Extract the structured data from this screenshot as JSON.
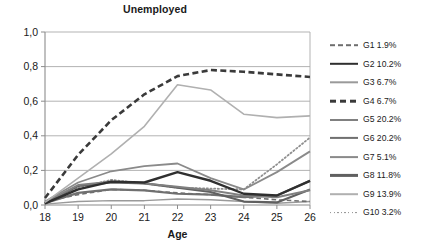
{
  "chart_data": {
    "type": "line",
    "title": "Unemployed",
    "xlabel": "Age",
    "ylabel": "",
    "x": [
      18,
      19,
      20,
      21,
      22,
      23,
      24,
      25,
      26
    ],
    "xtick_labels": [
      "18",
      "19",
      "20",
      "21",
      "22",
      "23",
      "24",
      "25",
      "26"
    ],
    "ytick_labels": [
      "0,0",
      "0,2",
      "0,4",
      "0,6",
      "0,8",
      "1,0"
    ],
    "ytick_values": [
      0.0,
      0.2,
      0.4,
      0.6,
      0.8,
      1.0
    ],
    "ylim": [
      0.0,
      1.0
    ],
    "xlim": [
      18,
      26
    ],
    "grid": "horizontal",
    "legend_position": "right",
    "series": [
      {
        "name": "G1 1.9%",
        "label": "G1 1.9%",
        "color": "#6e6e6e",
        "style": "dashed",
        "width": 1.6,
        "values": [
          0.02,
          0.06,
          0.09,
          0.085,
          0.07,
          0.06,
          0.045,
          0.03,
          0.02
        ]
      },
      {
        "name": "G2 10.2%",
        "label": "G2 10.2%",
        "color": "#2f2f2f",
        "style": "solid",
        "width": 2.4,
        "values": [
          0.01,
          0.09,
          0.135,
          0.13,
          0.19,
          0.14,
          0.065,
          0.055,
          0.14
        ]
      },
      {
        "name": "G3 6.7%",
        "label": "G3 6.7%",
        "color": "#9a9a9a",
        "style": "solid",
        "width": 1.4,
        "values": [
          0.005,
          0.02,
          0.025,
          0.025,
          0.035,
          0.03,
          0.02,
          0.01,
          0.02
        ]
      },
      {
        "name": "G4 6.7%",
        "label": "G4 6.7%",
        "color": "#3a3a3a",
        "style": "dashed",
        "width": 2.6,
        "values": [
          0.04,
          0.29,
          0.49,
          0.64,
          0.745,
          0.78,
          0.77,
          0.755,
          0.74
        ]
      },
      {
        "name": "G5 20.2%",
        "label": "G5 20.2%",
        "color": "#808080",
        "style": "solid",
        "width": 2.0,
        "values": [
          0.015,
          0.115,
          0.135,
          0.125,
          0.105,
          0.085,
          0.055,
          0.045,
          0.085
        ]
      },
      {
        "name": "G6 20.2%",
        "label": "G6 20.2%",
        "color": "#707070",
        "style": "solid",
        "width": 2.2,
        "values": [
          0.01,
          0.07,
          0.09,
          0.085,
          0.065,
          0.06,
          0.045,
          0.055,
          0.14
        ]
      },
      {
        "name": "G7 5.1%",
        "label": "G7 5.1%",
        "color": "#8a8a8a",
        "style": "solid",
        "width": 1.8,
        "values": [
          0.02,
          0.13,
          0.195,
          0.225,
          0.24,
          0.155,
          0.09,
          0.19,
          0.31
        ]
      },
      {
        "name": "G8 11.8%",
        "label": "G8 11.8%",
        "color": "#606060",
        "style": "solid",
        "width": 2.2,
        "values": [
          0.01,
          0.11,
          0.13,
          0.125,
          0.1,
          0.075,
          0.02,
          0.015,
          0.09
        ]
      },
      {
        "name": "G9 13.9%",
        "label": "G9 13.9%",
        "color": "#b0b0b0",
        "style": "solid",
        "width": 1.6,
        "values": [
          0.015,
          0.155,
          0.295,
          0.455,
          0.695,
          0.665,
          0.525,
          0.505,
          0.515
        ]
      },
      {
        "name": "G10 3.2%",
        "label": "G10 3.2%",
        "color": "#8f8f8f",
        "style": "dotted",
        "width": 1.8,
        "values": [
          0.01,
          0.1,
          0.145,
          0.125,
          0.1,
          0.095,
          0.09,
          0.235,
          0.39
        ]
      }
    ]
  },
  "axes": {
    "title": "Unemployed",
    "x_title": "Age"
  },
  "colors": {
    "background": "#ffffff",
    "grid": "#aaaaaa",
    "frame": "#8c8c8c",
    "text": "#1a1a1a"
  }
}
